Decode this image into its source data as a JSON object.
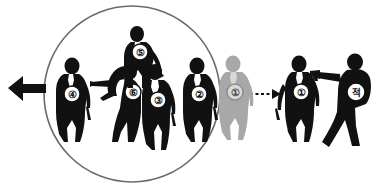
{
  "diagram": {
    "colors": {
      "figure_dark": "#111111",
      "figure_gray": "#a8a8a8",
      "badge_fill": "#ffffff",
      "badge_stroke": "#111111",
      "perimeter_stroke": "#6b6b6b",
      "arrow": "#111111",
      "background": "#ffffff"
    },
    "perimeter": {
      "label": "protective-cordon",
      "cx": 132,
      "cy": 94,
      "r": 88
    },
    "movement_arrow": {
      "label": "withdrawal-direction-arrow",
      "direction": "left",
      "style": "solid"
    },
    "threat_arrow": {
      "label": "threat-vector-arrow",
      "direction": "right",
      "style": "dashed"
    },
    "figures": [
      {
        "id": "guard-4",
        "badge": "④",
        "role": "Guard 4",
        "shade": "dark",
        "pose": "standing-left-flank"
      },
      {
        "id": "guard-6",
        "badge": "⑥",
        "role": "Guard 6",
        "shade": "dark",
        "pose": "bending-forward-reaching"
      },
      {
        "id": "guard-5",
        "badge": "⑤",
        "role": "Guard 5",
        "shade": "dark",
        "pose": "standing-rear-center"
      },
      {
        "id": "guard-3",
        "badge": "③",
        "role": "Guard 3",
        "shade": "dark",
        "pose": "standing-front-center"
      },
      {
        "id": "guard-2",
        "badge": "②",
        "role": "Guard 2",
        "shade": "dark",
        "pose": "standing-right-flank"
      },
      {
        "id": "vip-ghost",
        "badge": "①",
        "role": "VIP prior position",
        "shade": "gray",
        "pose": "standing"
      },
      {
        "id": "vip",
        "badge": "①",
        "role": "VIP",
        "shade": "dark",
        "pose": "standing"
      },
      {
        "id": "enemy",
        "badge": "적",
        "role": "Enemy",
        "shade": "dark",
        "pose": "aiming-pistol-left"
      }
    ]
  }
}
